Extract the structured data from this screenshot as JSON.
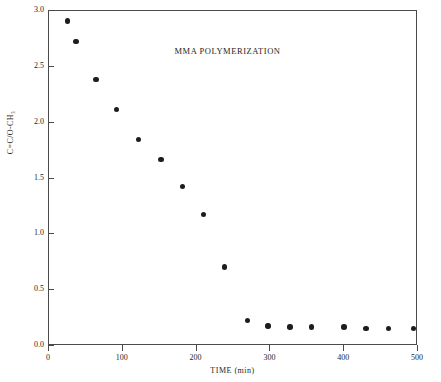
{
  "chart_data": {
    "type": "scatter",
    "title": "MMA POLYMERIZATION",
    "xlabel": "TIME (min)",
    "ylabel": "C=C/O-CH₃",
    "xlim": [
      0,
      500
    ],
    "ylim": [
      0.0,
      3.0
    ],
    "grid": false,
    "legend": null,
    "xticks": [
      0,
      100,
      200,
      300,
      400,
      500
    ],
    "xtick_labels": [
      "0",
      "100",
      "200",
      "300",
      "400",
      "500"
    ],
    "yticks": [
      0.0,
      0.5,
      1.0,
      1.5,
      2.0,
      2.5,
      3.0
    ],
    "ytick_labels": [
      "0.0",
      "0.5",
      "1.0",
      "1.5",
      "2.0",
      "2.5",
      "3.0"
    ],
    "series": [
      {
        "name": "C=C/O-CH3 ratio",
        "marker": "filled-circle",
        "color": "#1d1d1d",
        "x": [
          26,
          38,
          65,
          93,
          123,
          153,
          182,
          211,
          239,
          270,
          298,
          328,
          357,
          401,
          431,
          461,
          495
        ],
        "y": [
          2.9,
          2.72,
          2.38,
          2.11,
          1.84,
          1.66,
          1.42,
          1.17,
          0.7,
          0.22,
          0.17,
          0.16,
          0.16,
          0.16,
          0.15,
          0.15,
          0.15
        ]
      }
    ]
  },
  "figure": {
    "background_color": "#ffffff",
    "axis_color": "#4a4a4a",
    "text_color": "#231f1f"
  }
}
